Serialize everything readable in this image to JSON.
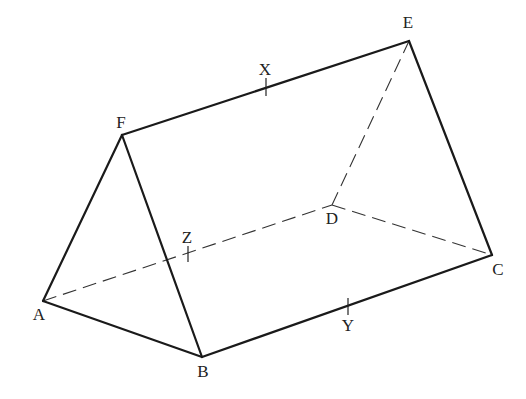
{
  "diagram": {
    "vertices": {
      "A": {
        "label": "A",
        "x": 43,
        "y": 301,
        "lx": 39,
        "ly": 320
      },
      "B": {
        "label": "B",
        "x": 202,
        "y": 357,
        "lx": 203,
        "ly": 377
      },
      "C": {
        "label": "C",
        "x": 492,
        "y": 255,
        "lx": 498,
        "ly": 275
      },
      "D": {
        "label": "D",
        "x": 332,
        "y": 205,
        "lx": 332,
        "ly": 224
      },
      "E": {
        "label": "E",
        "x": 409,
        "y": 41,
        "lx": 408,
        "ly": 28
      },
      "F": {
        "label": "F",
        "x": 122,
        "y": 135,
        "lx": 121,
        "ly": 128
      }
    },
    "midpoints": {
      "X": {
        "label": "X",
        "on_edge": "FE",
        "x": 266,
        "y": 87,
        "lx": 265,
        "ly": 75
      },
      "Y": {
        "label": "Y",
        "on_edge": "BC",
        "x": 348,
        "y": 307,
        "lx": 348,
        "ly": 331
      },
      "Z": {
        "label": "Z",
        "on_edge": "AD",
        "x": 188,
        "y": 255,
        "lx": 187,
        "ly": 243
      }
    },
    "solid_edges": [
      "AF",
      "FB",
      "AB",
      "BC",
      "CE",
      "FE"
    ],
    "hidden_edges": [
      "AD",
      "DC",
      "DE"
    ],
    "colors": {
      "line": "#1a1a1a",
      "background": "#ffffff"
    }
  }
}
